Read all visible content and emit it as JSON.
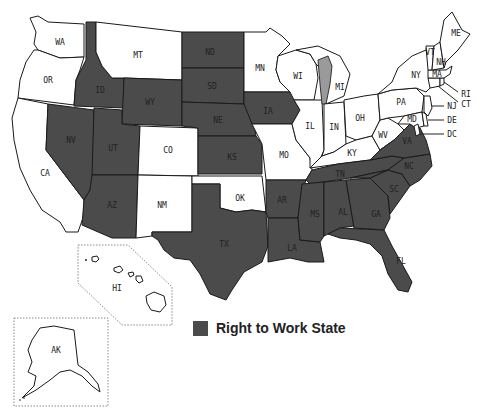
{
  "map": {
    "title_cropped": "",
    "legend": {
      "label": "Right to Work State",
      "color": "#4b4b4b"
    },
    "colors": {
      "right_to_work": "#4b4b4b",
      "non_right_to_work": "#ffffff",
      "border": "#1a1a1a",
      "lake": "#9a9a9a"
    },
    "states": {
      "WA": {
        "label": "WA",
        "rtw": false
      },
      "OR": {
        "label": "OR",
        "rtw": false
      },
      "CA": {
        "label": "CA",
        "rtw": false
      },
      "ID": {
        "label": "ID",
        "rtw": true
      },
      "NV": {
        "label": "NV",
        "rtw": true
      },
      "MT": {
        "label": "MT",
        "rtw": false
      },
      "WY": {
        "label": "WY",
        "rtw": true
      },
      "UT": {
        "label": "UT",
        "rtw": true
      },
      "AZ": {
        "label": "AZ",
        "rtw": true
      },
      "CO": {
        "label": "CO",
        "rtw": false
      },
      "NM": {
        "label": "NM",
        "rtw": false
      },
      "ND": {
        "label": "ND",
        "rtw": true
      },
      "SD": {
        "label": "SD",
        "rtw": true
      },
      "NE": {
        "label": "NE",
        "rtw": true
      },
      "KS": {
        "label": "KS",
        "rtw": true
      },
      "OK": {
        "label": "OK",
        "rtw": false
      },
      "TX": {
        "label": "TX",
        "rtw": true
      },
      "MN": {
        "label": "MN",
        "rtw": false
      },
      "IA": {
        "label": "IA",
        "rtw": true
      },
      "MO": {
        "label": "MO",
        "rtw": false
      },
      "AR": {
        "label": "AR",
        "rtw": true
      },
      "LA": {
        "label": "LA",
        "rtw": true
      },
      "WI": {
        "label": "WI",
        "rtw": false
      },
      "IL": {
        "label": "IL",
        "rtw": false
      },
      "MI": {
        "label": "MI",
        "rtw": false
      },
      "IN": {
        "label": "IN",
        "rtw": false
      },
      "OH": {
        "label": "OH",
        "rtw": false
      },
      "KY": {
        "label": "KY",
        "rtw": false
      },
      "TN": {
        "label": "TN",
        "rtw": true
      },
      "MS": {
        "label": "MS",
        "rtw": true
      },
      "AL": {
        "label": "AL",
        "rtw": true
      },
      "GA": {
        "label": "GA",
        "rtw": true
      },
      "FL": {
        "label": "FL",
        "rtw": true
      },
      "SC": {
        "label": "SC",
        "rtw": true
      },
      "NC": {
        "label": "NC",
        "rtw": true
      },
      "VA": {
        "label": "VA",
        "rtw": true
      },
      "WV": {
        "label": "WV",
        "rtw": false
      },
      "PA": {
        "label": "PA",
        "rtw": false
      },
      "NY": {
        "label": "NY",
        "rtw": false
      },
      "MD": {
        "label": "MD",
        "rtw": false
      },
      "DE": {
        "label": "DE",
        "rtw": false
      },
      "NJ": {
        "label": "NJ",
        "rtw": false
      },
      "DC": {
        "label": "DC",
        "rtw": false
      },
      "CT": {
        "label": "CT",
        "rtw": false
      },
      "RI": {
        "label": "RI",
        "rtw": false
      },
      "MA": {
        "label": "MA",
        "rtw": false
      },
      "VT": {
        "label": "VT",
        "rtw": false
      },
      "NH": {
        "label": "NH",
        "rtw": false
      },
      "ME": {
        "label": "ME",
        "rtw": false
      },
      "HI": {
        "label": "HI",
        "rtw": false
      },
      "AK": {
        "label": "AK",
        "rtw": false
      }
    }
  }
}
